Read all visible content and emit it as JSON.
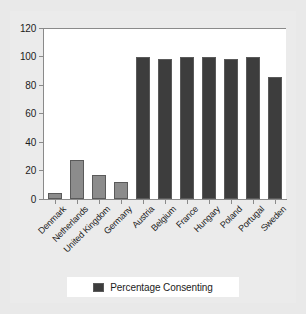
{
  "chart_data": {
    "type": "bar",
    "title": "",
    "xlabel": "",
    "ylabel": "",
    "ylim": [
      0,
      120
    ],
    "yticks": [
      0,
      20,
      40,
      60,
      80,
      100,
      120
    ],
    "grid": false,
    "legend_position": "bottom",
    "categories": [
      "Denmark",
      "Netherlands",
      "United Kingdom",
      "Germany",
      "Austria",
      "Belgium",
      "France",
      "Hungary",
      "Poland",
      "Portugal",
      "Sweden"
    ],
    "series": [
      {
        "name": "Percentage Consenting",
        "values": [
          4.25,
          27.5,
          17.17,
          12,
          99.9,
          98,
          99.5,
          99.9,
          98.5,
          99.5,
          85.9
        ]
      }
    ],
    "bar_colors": [
      "#8c8c8c",
      "#8c8c8c",
      "#8c8c8c",
      "#8c8c8c",
      "#3d3d3d",
      "#3d3d3d",
      "#3d3d3d",
      "#3d3d3d",
      "#3d3d3d",
      "#3d3d3d",
      "#3d3d3d"
    ]
  },
  "legend": {
    "entries": [
      {
        "label": "Percentage Consenting",
        "color": "#3d3d3d"
      }
    ]
  },
  "colors": {
    "figure_background": "#ebebeb",
    "page_background": "#e9e9e9",
    "panel_background": "#ffffff",
    "axis": "#8a8a8a",
    "text": "#1c1c1c",
    "bar_light": "#8c8c8c",
    "bar_dark": "#3d3d3d"
  }
}
